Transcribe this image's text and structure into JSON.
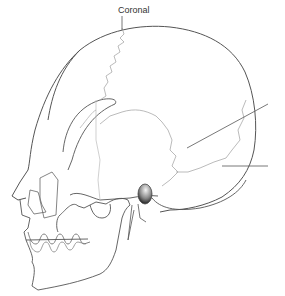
{
  "diagram": {
    "labels": {
      "coronal": "Coronal",
      "right_upper": "",
      "right_lower": ""
    },
    "colors": {
      "outline": "#555555",
      "suture": "#aaaaaa",
      "leader": "#555555",
      "background": "#ffffff"
    }
  }
}
